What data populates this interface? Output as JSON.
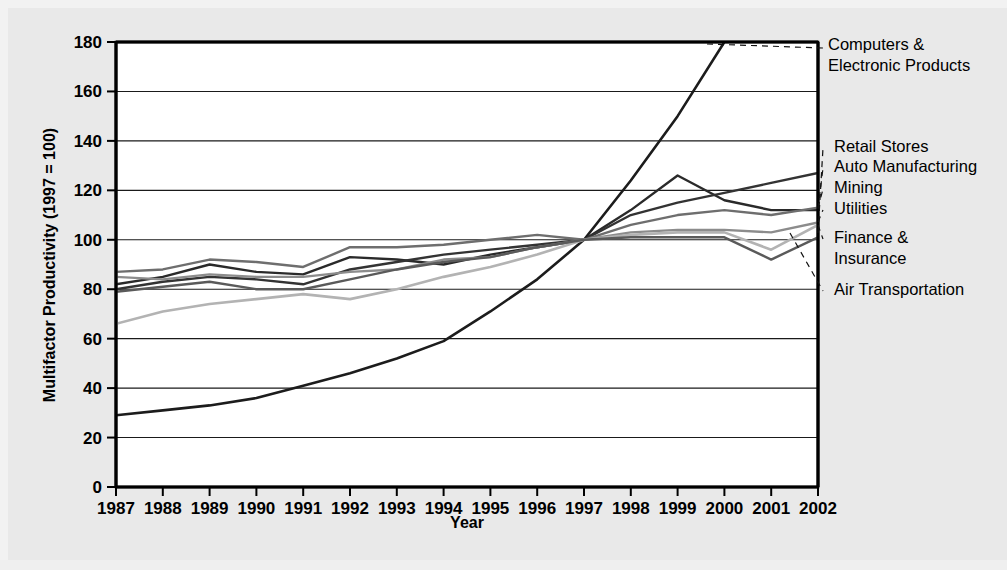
{
  "chart_data": {
    "type": "line",
    "title": "",
    "xlabel": "Year",
    "ylabel": "Multifactor Productivity (1997 = 100)",
    "x": [
      1987,
      1988,
      1989,
      1990,
      1991,
      1992,
      1993,
      1994,
      1995,
      1996,
      1997,
      1998,
      1999,
      2000,
      2001,
      2002
    ],
    "xtick_labels": [
      "1987",
      "1988",
      "1989",
      "1990",
      "1991",
      "1992",
      "1993",
      "1994",
      "1995",
      "1996",
      "1997",
      "1998",
      "1999",
      "2000",
      "2001",
      "2002"
    ],
    "ytick_labels": [
      "0",
      "20",
      "40",
      "60",
      "80",
      "100",
      "120",
      "140",
      "160",
      "180"
    ],
    "yticks": [
      0,
      20,
      40,
      60,
      80,
      100,
      120,
      140,
      160,
      180
    ],
    "ylim": [
      0,
      180
    ],
    "xlim": [
      1987,
      2002
    ],
    "grid": "horizontal",
    "legend_position": "right-outside-annotations",
    "note": "Series clipped at the top of the plot: Computers & Electronic Products exceeds 180 after 2000.",
    "series": [
      {
        "name": "Computers & Electronic Products",
        "color": "#1c1c1c",
        "width": 2.6,
        "values": [
          29,
          31,
          33,
          36,
          41,
          46,
          52,
          59,
          71,
          84,
          100,
          124,
          150,
          180,
          205,
          232
        ],
        "clipped_above": 180,
        "label_anchor_year": 2000
      },
      {
        "name": "Retail Stores",
        "color": "#2a2a2a",
        "width": 2.4,
        "values": [
          82,
          85,
          90,
          87,
          86,
          93,
          92,
          90,
          94,
          97,
          100,
          112,
          126,
          116,
          112,
          112
        ],
        "label_anchor_year": 2002
      },
      {
        "name": "Auto Manufacturing",
        "color": "#333333",
        "width": 2.4,
        "values": [
          80,
          83,
          85,
          84,
          82,
          88,
          91,
          94,
          96,
          98,
          100,
          110,
          115,
          119,
          123,
          127
        ],
        "label_anchor_year": 2002
      },
      {
        "name": "Mining",
        "color": "#6e6e6e",
        "width": 2.4,
        "values": [
          87,
          88,
          92,
          91,
          89,
          97,
          97,
          98,
          100,
          102,
          100,
          106,
          110,
          112,
          110,
          113
        ],
        "label_anchor_year": 2002
      },
      {
        "name": "Utilities",
        "color": "#8c8c8c",
        "width": 2.4,
        "values": [
          85,
          84,
          86,
          85,
          85,
          87,
          88,
          92,
          93,
          97,
          100,
          103,
          104,
          104,
          103,
          107
        ],
        "label_anchor_year": 2002
      },
      {
        "name": "Finance & Insurance",
        "color": "#b3b3b3",
        "width": 2.6,
        "values": [
          66,
          71,
          74,
          76,
          78,
          76,
          80,
          85,
          89,
          94,
          100,
          102,
          103,
          103,
          96,
          106
        ],
        "label_anchor_year": 2002
      },
      {
        "name": "Air Transportation",
        "color": "#5a5a5a",
        "width": 2.4,
        "values": [
          79,
          81,
          83,
          80,
          80,
          84,
          88,
          91,
          93,
          97,
          100,
          101,
          101,
          101,
          92,
          101
        ],
        "label_anchor_year": 2002
      }
    ],
    "annotations": [
      {
        "text_lines": [
          "Computers &",
          "Electronic Products"
        ],
        "x": 828,
        "y": 50
      },
      {
        "text_lines": [
          "Retail Stores"
        ],
        "x": 834,
        "y": 152
      },
      {
        "text_lines": [
          "Auto Manufacturing"
        ],
        "x": 834,
        "y": 172
      },
      {
        "text_lines": [
          "Mining"
        ],
        "x": 834,
        "y": 193
      },
      {
        "text_lines": [
          "Utilities"
        ],
        "x": 834,
        "y": 214
      },
      {
        "text_lines": [
          "Finance &",
          "Insurance"
        ],
        "x": 834,
        "y": 243
      },
      {
        "text_lines": [
          "Air Transportation"
        ],
        "x": 834,
        "y": 295
      }
    ]
  },
  "axes": {
    "y_title": "Multifactor Productivity (1997 = 100)",
    "x_title": "Year"
  }
}
